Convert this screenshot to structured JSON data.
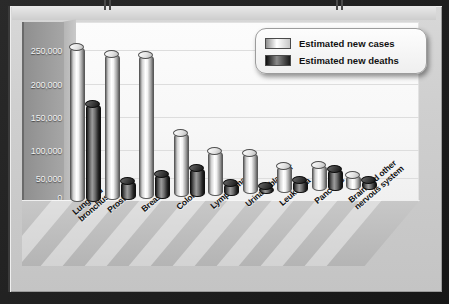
{
  "chart_data": {
    "type": "bar",
    "title": "",
    "xlabel": "",
    "ylabel": "",
    "ylim": [
      0,
      250000
    ],
    "grid": true,
    "legend_position": "top-right",
    "categories": [
      "Lung and\nbronchus",
      "Prostate",
      "Breast",
      "Colon",
      "Lymphoma",
      "Urinary/bladder",
      "Leukemia",
      "Pancreas",
      "Brain and other\nnervous system"
    ],
    "yticks": [
      "0",
      "50,000",
      "100,000",
      "150,000",
      "200,000",
      "250,000"
    ],
    "ytick_values": [
      0,
      50000,
      100000,
      150000,
      200000,
      250000
    ],
    "series": [
      {
        "name": "Estimated new cases",
        "values": [
          256000,
          242000,
          238000,
          107000,
          74000,
          68000,
          44000,
          43000,
          24000
        ]
      },
      {
        "name": "Estimated new deaths",
        "values": [
          162000,
          32000,
          41000,
          48000,
          21000,
          14000,
          21000,
          37000,
          16000
        ]
      }
    ]
  },
  "legend": {
    "items": [
      {
        "label": "Estimated new cases",
        "color": "#ffffff"
      },
      {
        "label": "Estimated new deaths",
        "color": "#1a1a1a"
      }
    ]
  },
  "colors": {
    "frame": "#1c1c1c",
    "slab": "#cfcfcf",
    "plot_background": "#fbfbfb",
    "gridline": "#dddddd",
    "axis_block": "#9a9a9a",
    "axis_text": "#f2f2f2",
    "label_text": "#111111"
  }
}
